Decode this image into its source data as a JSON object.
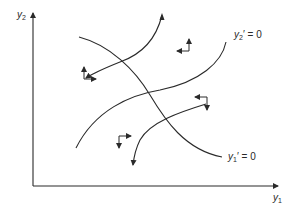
{
  "diagram": {
    "type": "phase-diagram",
    "axes": {
      "x": {
        "var": "y",
        "sub": "1"
      },
      "y": {
        "var": "y",
        "sub": "2"
      }
    },
    "isoclines": [
      {
        "id": "y1-nullcline",
        "var": "y",
        "sub": "1",
        "rest": "′ = 0",
        "shape": "decreasing"
      },
      {
        "id": "y2-nullcline",
        "var": "y",
        "sub": "2",
        "rest": "′ = 0",
        "shape": "increasing"
      }
    ],
    "trajectories": [
      {
        "id": "trajectory-upper",
        "direction": "arrows at both ends (up-right and down-left)"
      },
      {
        "id": "trajectory-lower",
        "direction": "arrow pointing down-left"
      }
    ],
    "direction_arrows": [
      {
        "region": "left",
        "vertical": "up",
        "horizontal": "right"
      },
      {
        "region": "top",
        "vertical": "up",
        "horizontal": "left"
      },
      {
        "region": "right",
        "vertical": "down",
        "horizontal": "left"
      },
      {
        "region": "bottom",
        "vertical": "down",
        "horizontal": "right"
      }
    ],
    "colors": {
      "line": "#2a2a2a",
      "background": "#ffffff"
    }
  }
}
